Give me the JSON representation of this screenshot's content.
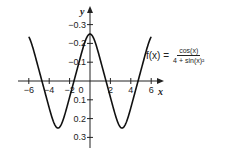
{
  "chart_data": {
    "type": "line",
    "title": "",
    "function_label": "f(x) = cos(x) / (4 + sin(x)^2)",
    "xlabel": "x",
    "ylabel": "y",
    "xlim": [
      -6.5,
      7
    ],
    "ylim": [
      -0.35,
      0.35
    ],
    "xticks": [
      -6,
      -4,
      -2,
      0,
      2,
      4,
      6
    ],
    "yticks": [
      -0.3,
      -0.2,
      -0.1,
      0.1,
      0.2,
      0.3
    ],
    "grid": false,
    "series": [
      {
        "name": "f(x)",
        "x": [
          -6,
          -5.5,
          -5,
          -4.5,
          -4,
          -3.5,
          -3.14,
          -2.5,
          -2,
          -1.5,
          -1,
          -0.5,
          0,
          0.5,
          1,
          1.5,
          2,
          2.5,
          3.14,
          3.5,
          4,
          4.5,
          5.0,
          5.5,
          6
        ],
        "values": [
          0.235,
          0.165,
          0.058,
          -0.045,
          -0.139,
          -0.224,
          -0.25,
          -0.188,
          -0.087,
          0.014,
          0.115,
          0.208,
          0.25,
          0.208,
          0.115,
          0.014,
          -0.087,
          -0.188,
          -0.25,
          -0.224,
          -0.139,
          -0.045,
          0.058,
          0.165,
          0.235
        ]
      }
    ]
  },
  "labels": {
    "x_axis": "x",
    "y_axis": "y",
    "xtick_labels": [
      "−6",
      "−4",
      "−2",
      "0",
      "2",
      "4",
      "6"
    ],
    "ytick_labels": [
      "0.3",
      "0.2",
      "0.1",
      "−0.1",
      "−0.2",
      "−0.3"
    ],
    "formula_name": "f(x) =",
    "formula_num": "cos(x)",
    "formula_den": "4 + sin(x)²"
  }
}
